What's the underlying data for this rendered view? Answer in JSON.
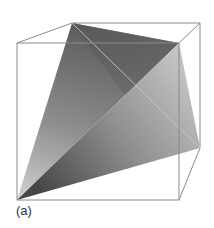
{
  "figure": {
    "caption": "(a)",
    "cube_edge_color": "#8a8a8a",
    "hidden_edge_color": "#c8c8c8",
    "vertices": {
      "A": [
        72,
        23
      ],
      "B": [
        179,
        43
      ],
      "C": [
        200,
        148
      ],
      "D": [
        17,
        200
      ]
    },
    "cube": {
      "front": [
        [
          17,
          43
        ],
        [
          179,
          43
        ],
        [
          179,
          200
        ],
        [
          17,
          200
        ]
      ],
      "back": [
        [
          72,
          23
        ],
        [
          200,
          23
        ],
        [
          200,
          148
        ]
      ]
    },
    "faces": [
      {
        "name": "face-ABD",
        "colors": [
          "#5a5a5a",
          "#9a9a9a",
          "#cfcfcf"
        ]
      },
      {
        "name": "face-BCD",
        "colors": [
          "#bdbdbd",
          "#8f8f8f",
          "#4a4a4a"
        ]
      }
    ]
  }
}
